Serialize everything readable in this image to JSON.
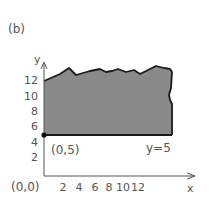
{
  "figure_label": "(b)",
  "axes": {
    "x_label": "x",
    "y_label": "y",
    "origin_label": "(0,0)",
    "x_ticks": [
      "2",
      "4",
      "6",
      "8",
      "10",
      "12"
    ],
    "y_ticks": [
      "2",
      "4",
      "6",
      "8",
      "10",
      "12"
    ]
  },
  "region": {
    "description": "shaded region above the line y=5 extending to x≥0",
    "boundary_label": "y=5",
    "corner_point_label": "(0,5)",
    "fill_color": "#8a8a8a",
    "edge_color": "#1a1a1a"
  }
}
